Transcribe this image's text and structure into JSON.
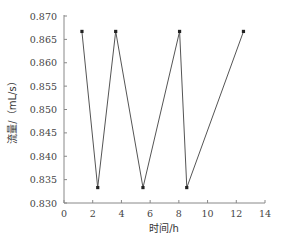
{
  "chart_data": {
    "type": "line",
    "title": "",
    "xlabel": "时间/h",
    "ylabel": "流量/（mL/s）",
    "xlim": [
      0,
      14
    ],
    "ylim": [
      0.83,
      0.87
    ],
    "xticks": [
      0,
      2,
      4,
      6,
      8,
      10,
      12,
      14
    ],
    "yticks": [
      0.83,
      0.835,
      0.84,
      0.845,
      0.85,
      0.855,
      0.86,
      0.865,
      0.87
    ],
    "ytick_labels": [
      "0.830",
      "0.835",
      "0.840",
      "0.845",
      "0.850",
      "0.855",
      "0.860",
      "0.865",
      "0.870"
    ],
    "grid": false,
    "legend": null,
    "series": [
      {
        "name": "流量",
        "color": "#333333",
        "marker": "square",
        "x": [
          1.25,
          2.35,
          3.6,
          5.5,
          8.05,
          8.55,
          12.5
        ],
        "y": [
          0.8667,
          0.8333,
          0.8667,
          0.8333,
          0.8667,
          0.8333,
          0.8667
        ]
      }
    ]
  },
  "colors": {
    "axis": "#888888",
    "line": "#555555",
    "marker": "#222222"
  }
}
